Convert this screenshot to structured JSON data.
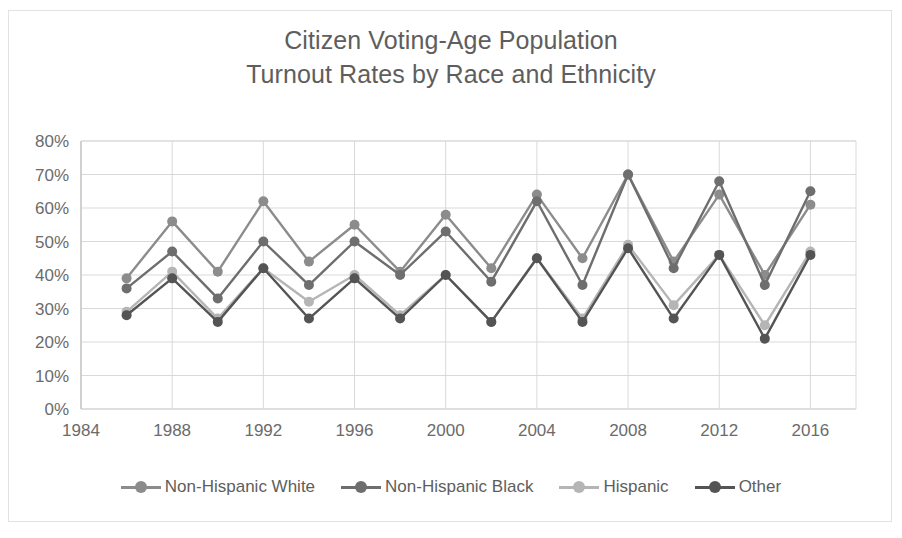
{
  "chart_data": {
    "type": "line",
    "title": "Citizen Voting-Age Population Turnout Rates by Race and Ethnicity",
    "title_line1": "Citizen Voting-Age Population",
    "title_line2": "Turnout Rates by Race and Ethnicity",
    "xlabel": "",
    "ylabel": "",
    "grid": true,
    "legend_position": "bottom",
    "ylim": [
      0,
      80
    ],
    "yticks": [
      0,
      10,
      20,
      30,
      40,
      50,
      60,
      70,
      80
    ],
    "ytick_labels": [
      "0%",
      "10%",
      "20%",
      "30%",
      "40%",
      "50%",
      "60%",
      "70%",
      "80%"
    ],
    "xlim": [
      1984,
      2018
    ],
    "xticks": [
      1984,
      1988,
      1992,
      1996,
      2000,
      2004,
      2008,
      2012,
      2016
    ],
    "xtick_labels": [
      "1984",
      "1988",
      "1992",
      "1996",
      "2000",
      "2004",
      "2008",
      "2012",
      "2016"
    ],
    "x": [
      1986,
      1988,
      1990,
      1992,
      1994,
      1996,
      1998,
      2000,
      2002,
      2004,
      2006,
      2008,
      2010,
      2012,
      2014,
      2016
    ],
    "series": [
      {
        "name": "Non-Hispanic White",
        "color": "#8c8c8c",
        "values": [
          39,
          56,
          41,
          62,
          44,
          55,
          41,
          58,
          42,
          64,
          45,
          70,
          44,
          64,
          40,
          61
        ]
      },
      {
        "name": "Non-Hispanic Black",
        "color": "#6e6e6e",
        "values": [
          36,
          47,
          33,
          50,
          37,
          50,
          40,
          53,
          38,
          62,
          37,
          70,
          42,
          68,
          37,
          65
        ]
      },
      {
        "name": "Hispanic",
        "color": "#b5b5b5",
        "values": [
          29,
          41,
          27,
          42,
          32,
          40,
          28,
          40,
          26,
          45,
          27,
          49,
          31,
          46,
          25,
          47
        ]
      },
      {
        "name": "Other",
        "color": "#545454",
        "values": [
          28,
          39,
          26,
          42,
          27,
          39,
          27,
          40,
          26,
          45,
          26,
          48,
          27,
          46,
          21,
          46
        ]
      }
    ]
  },
  "legend": {
    "items": [
      {
        "label": "Non-Hispanic White",
        "color": "#8c8c8c"
      },
      {
        "label": "Non-Hispanic Black",
        "color": "#6e6e6e"
      },
      {
        "label": "Hispanic",
        "color": "#b5b5b5"
      },
      {
        "label": "Other",
        "color": "#545454"
      }
    ]
  }
}
